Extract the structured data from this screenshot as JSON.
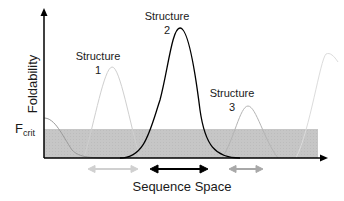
{
  "diagram": {
    "title": "",
    "y_axis_label": "Foldability",
    "x_axis_label": "Sequence Space",
    "threshold_label_main": "F",
    "threshold_label_sub": "crit",
    "structures": [
      {
        "label_line1": "Structure",
        "label_line2": "1",
        "color": "#c8c8c8"
      },
      {
        "label_line1": "Structure",
        "label_line2": "2",
        "color": "#000000"
      },
      {
        "label_line1": "Structure",
        "label_line2": "3",
        "color": "#bdbdbd"
      }
    ],
    "threshold_band_color": "#c4c4c4",
    "arrows": [
      {
        "name": "structure-1-range",
        "color": "#d0d0d0"
      },
      {
        "name": "structure-2-range",
        "color": "#000000"
      },
      {
        "name": "structure-3-range",
        "color": "#a8a8a8"
      }
    ]
  }
}
